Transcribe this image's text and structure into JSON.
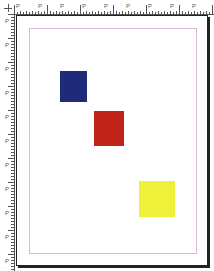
{
  "ruler": {
    "top_label": "P",
    "left_label": "P",
    "top_labels": [
      "P",
      "P",
      "P",
      "P",
      "P",
      "P",
      "P",
      "P",
      "P"
    ],
    "left_labels": [
      "P",
      "P",
      "P",
      "P",
      "P",
      "P",
      "P",
      "P",
      "P",
      "P",
      "P"
    ]
  },
  "page": {
    "margin_guide_color": "#d9b8d8",
    "border_color": "#222222"
  },
  "shapes": [
    {
      "name": "blue-rectangle",
      "color": "#1f2a7a",
      "x": 60,
      "y": 71,
      "w": 27,
      "h": 31
    },
    {
      "name": "red-rectangle",
      "color": "#c0231a",
      "x": 94,
      "y": 111,
      "w": 30,
      "h": 35
    },
    {
      "name": "yellow-rectangle",
      "color": "#eef03a",
      "x": 139,
      "y": 181,
      "w": 36,
      "h": 36
    }
  ]
}
